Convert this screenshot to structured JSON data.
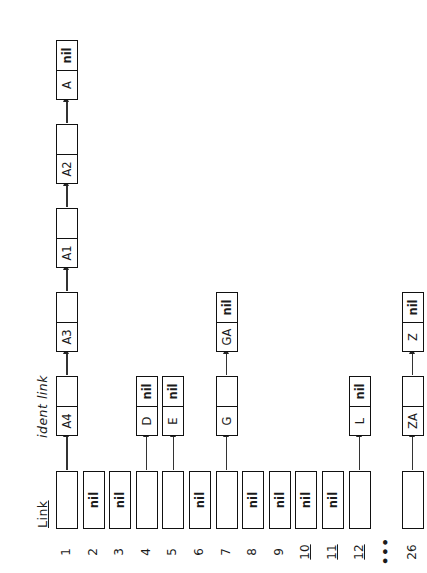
{
  "figure": {
    "caption": "Hash table with 26 buckets; each bucket can hold a link.",
    "column_header": "Link",
    "node_header": "ident link",
    "ellipsis": "•••",
    "nil_text": "nil",
    "colors": {
      "ink": "#111111",
      "paper": "#ffffff",
      "connector": "#333333"
    },
    "buckets": [
      {
        "number": "1",
        "empty": false,
        "chain": [
          {
            "ident": "A4",
            "link": ""
          },
          {
            "ident": "A3",
            "link": ""
          },
          {
            "ident": "A1",
            "link": ""
          },
          {
            "ident": "A2",
            "link": ""
          },
          {
            "ident": "A",
            "link": "nil"
          }
        ]
      },
      {
        "number": "2",
        "empty": true,
        "chain": []
      },
      {
        "number": "3",
        "empty": true,
        "chain": []
      },
      {
        "number": "4",
        "empty": false,
        "chain": [
          {
            "ident": "D",
            "link": "nil"
          }
        ]
      },
      {
        "number": "5",
        "empty": false,
        "chain": [
          {
            "ident": "E",
            "link": "nil"
          }
        ]
      },
      {
        "number": "6",
        "empty": true,
        "chain": []
      },
      {
        "number": "7",
        "empty": false,
        "chain": [
          {
            "ident": "G",
            "link": ""
          },
          {
            "ident": "GA",
            "link": "nil"
          }
        ]
      },
      {
        "number": "8",
        "empty": true,
        "chain": []
      },
      {
        "number": "9",
        "empty": true,
        "chain": []
      },
      {
        "number": "10",
        "empty": true,
        "chain": []
      },
      {
        "number": "11",
        "empty": true,
        "chain": []
      },
      {
        "number": "12",
        "empty": false,
        "chain": [
          {
            "ident": "L",
            "link": "nil"
          }
        ]
      },
      {
        "number": "•••",
        "ellipsis": true,
        "empty": true,
        "chain": []
      },
      {
        "number": "26",
        "empty": false,
        "chain": [
          {
            "ident": "ZA",
            "link": ""
          },
          {
            "ident": "Z",
            "link": "nil"
          }
        ]
      }
    ]
  }
}
